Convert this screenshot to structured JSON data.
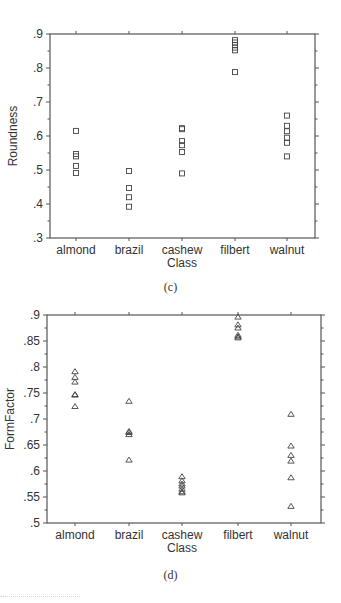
{
  "chart_data": [
    {
      "type": "scatter",
      "panel": "(c)",
      "title": "",
      "xlabel": "Class",
      "ylabel": "Roundness",
      "marker": "square",
      "categories": [
        "almond",
        "brazil",
        "cashew",
        "filbert",
        "walnut"
      ],
      "ylim": [
        0.3,
        0.9
      ],
      "yticks": [
        ".3",
        ".4",
        ".5",
        ".6",
        ".7",
        ".8",
        ".9"
      ],
      "grid": false,
      "series": [
        {
          "name": "almond",
          "values": [
            0.615,
            0.547,
            0.54,
            0.512,
            0.491
          ]
        },
        {
          "name": "brazil",
          "values": [
            0.497,
            0.447,
            0.42,
            0.392
          ]
        },
        {
          "name": "cashew",
          "values": [
            0.623,
            0.62,
            0.585,
            0.573,
            0.553,
            0.49
          ]
        },
        {
          "name": "filbert",
          "values": [
            0.882,
            0.875,
            0.868,
            0.86,
            0.852,
            0.788
          ]
        },
        {
          "name": "walnut",
          "values": [
            0.66,
            0.63,
            0.614,
            0.595,
            0.58,
            0.54
          ]
        }
      ]
    },
    {
      "type": "scatter",
      "panel": "(d)",
      "title": "",
      "xlabel": "Class",
      "ylabel": "FormFactor",
      "marker": "triangle",
      "categories": [
        "almond",
        "brazil",
        "cashew",
        "filbert",
        "walnut"
      ],
      "ylim": [
        0.5,
        0.9
      ],
      "yticks": [
        ".5",
        ".55",
        ".6",
        ".65",
        ".7",
        ".75",
        ".8",
        ".85",
        ".9"
      ],
      "grid": false,
      "series": [
        {
          "name": "almond",
          "values": [
            0.791,
            0.78,
            0.771,
            0.747,
            0.746,
            0.724
          ]
        },
        {
          "name": "brazil",
          "values": [
            0.734,
            0.676,
            0.674,
            0.67,
            0.621
          ]
        },
        {
          "name": "cashew",
          "values": [
            0.589,
            0.581,
            0.575,
            0.571,
            0.565,
            0.56,
            0.558
          ]
        },
        {
          "name": "filbert",
          "values": [
            0.896,
            0.881,
            0.875,
            0.861,
            0.858,
            0.856
          ]
        },
        {
          "name": "walnut",
          "values": [
            0.709,
            0.648,
            0.63,
            0.619,
            0.587,
            0.532
          ]
        }
      ]
    }
  ],
  "captions": {
    "c": "(c)",
    "d": "(d)"
  },
  "colors": {
    "axis": "#555555",
    "marker": "#444444",
    "text": "#333333"
  }
}
